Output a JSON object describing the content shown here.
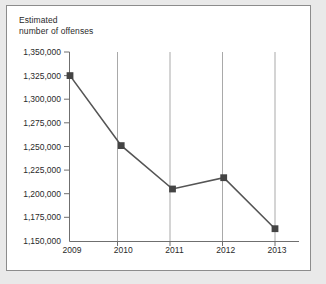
{
  "figure": {
    "background_color": "#e9e9e9",
    "panel_color": "#ffffff",
    "frame_color": "#8c8c8c"
  },
  "chart_data": {
    "type": "line",
    "title": "",
    "ylabel": "Estimated\nnumber of offenses",
    "ylabel_line1": "Estimated",
    "ylabel_line2": "number of offenses",
    "xlabel": "",
    "categories": [
      "2009",
      "2010",
      "2011",
      "2012",
      "2013"
    ],
    "x": [
      2009,
      2010,
      2011,
      2012,
      2013
    ],
    "values": [
      1325000,
      1251000,
      1205000,
      1217000,
      1163000
    ],
    "series": [
      {
        "name": "Estimated number of offenses",
        "values": [
          1325000,
          1251000,
          1205000,
          1217000,
          1163000
        ]
      }
    ],
    "ylim": [
      1150000,
      1350000
    ],
    "ytick_step": 25000,
    "ytick_labels": [
      "1,350,000",
      "1,325,000",
      "1,300,000",
      "1,275,000",
      "1,250,000",
      "1,225,000",
      "1,200,000",
      "1,175,000",
      "1,150,000"
    ],
    "ytick_values": [
      1350000,
      1325000,
      1300000,
      1275000,
      1250000,
      1225000,
      1200000,
      1175000,
      1150000
    ],
    "xtick_labels": [
      "2009",
      "2010",
      "2011",
      "2012",
      "2013"
    ],
    "grid": "vertical",
    "grid_color": "#aaaaaa",
    "legend": "none",
    "line_color": "#555555",
    "marker_color": "#444444",
    "marker_shape": "square",
    "axis_color": "#6f6f6f"
  }
}
